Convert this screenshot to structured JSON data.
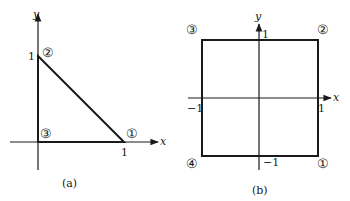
{
  "figure_a": {
    "caption": "(a)",
    "axes": {
      "x_label": "x",
      "y_label": "y"
    },
    "ticks": {
      "y_one": "1",
      "x_one": "1"
    },
    "shape": "triangle",
    "vertices": [
      {
        "id": 1,
        "glyph": "①",
        "coords": [
          1,
          0
        ]
      },
      {
        "id": 2,
        "glyph": "②",
        "coords": [
          0,
          1
        ]
      },
      {
        "id": 3,
        "glyph": "③",
        "coords": [
          0,
          0
        ]
      }
    ]
  },
  "figure_b": {
    "caption": "(b)",
    "axes": {
      "x_label": "x",
      "y_label": "y"
    },
    "ticks": {
      "y_one": "1",
      "y_neg_one": "−1",
      "x_one": "1",
      "x_neg_one": "−1"
    },
    "shape": "square",
    "vertices": [
      {
        "id": 1,
        "glyph": "①",
        "coords": [
          1,
          -1
        ]
      },
      {
        "id": 2,
        "glyph": "②",
        "coords": [
          1,
          1
        ]
      },
      {
        "id": 3,
        "glyph": "③",
        "coords": [
          -1,
          1
        ]
      },
      {
        "id": 4,
        "glyph": "④",
        "coords": [
          -1,
          -1
        ]
      }
    ]
  },
  "colors": {
    "ink": "#1a1a1a",
    "background": "#ffffff"
  }
}
